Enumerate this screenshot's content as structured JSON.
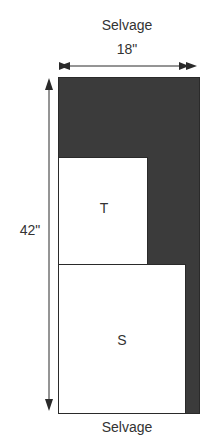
{
  "labels": {
    "top_selvage": "Selvage",
    "width": "18\"",
    "height": "42\"",
    "piece_t": "T",
    "piece_s": "S",
    "bottom_selvage": "Selvage"
  },
  "colors": {
    "fabric_fill": "#3b3b3b",
    "piece_fill": "#ffffff",
    "stroke": "#2a2a2a"
  }
}
